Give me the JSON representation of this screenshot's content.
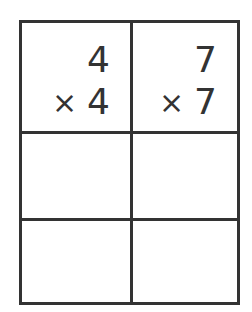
{
  "worksheet": {
    "problems": [
      {
        "multiplicand": "4",
        "operator": "×",
        "multiplier": "4",
        "answer": ""
      },
      {
        "multiplicand": "7",
        "operator": "×",
        "multiplier": "7",
        "answer": ""
      }
    ],
    "rows": 3,
    "columns": 2,
    "line_color": "#333333",
    "text_color": "#333333"
  }
}
